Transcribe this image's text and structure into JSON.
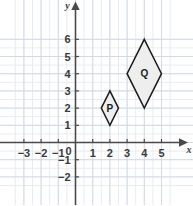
{
  "chart_data": {
    "type": "scatter",
    "title": "",
    "xlabel": "x",
    "ylabel": "y",
    "grid": true,
    "minor_grid": true,
    "minor_grid_step": 0.5,
    "legend": "none",
    "xlim": [
      -3.6,
      5.8
    ],
    "ylim": [
      -2.6,
      6.4
    ],
    "x_ticks": [
      -3,
      -2,
      -1,
      1,
      2,
      3,
      4,
      5
    ],
    "y_ticks": [
      -2,
      -1,
      1,
      2,
      3,
      4,
      5,
      6
    ],
    "origin_label": "0",
    "x_tick_labels": [
      "-3",
      "-2",
      "-1",
      "1",
      "2",
      "3",
      "4",
      "5"
    ],
    "y_tick_labels": [
      "-2",
      "-1",
      "1",
      "2",
      "3",
      "4",
      "5",
      "6"
    ],
    "shapes": [
      {
        "name": "P",
        "label": "P",
        "kind": "rhombus",
        "vertices": [
          [
            2,
            3
          ],
          [
            2.5,
            2
          ],
          [
            2,
            1
          ],
          [
            1.5,
            2
          ]
        ],
        "label_at": [
          2,
          2
        ],
        "fill": "#eeeeee",
        "stroke": "#1c1c1c"
      },
      {
        "name": "Q",
        "label": "Q",
        "kind": "rhombus",
        "vertices": [
          [
            4,
            6
          ],
          [
            5,
            4
          ],
          [
            4,
            2
          ],
          [
            3,
            4
          ]
        ],
        "label_at": [
          4,
          4
        ],
        "fill": "#eeeeee",
        "stroke": "#1c1c1c"
      }
    ]
  },
  "colors": {
    "background": "#ffffff",
    "minor_grid": "#e8ecf2",
    "major_grid": "#d3dae4",
    "axis": "#4a4a4a",
    "shape_fill": "#eeeeee",
    "shape_stroke": "#1c1c1c",
    "text": "#3a3a3a"
  },
  "axes": {
    "x_axis_name": "x",
    "y_axis_name": "y",
    "x_arrow": "arrow-right",
    "y_arrow": "arrow-up"
  }
}
